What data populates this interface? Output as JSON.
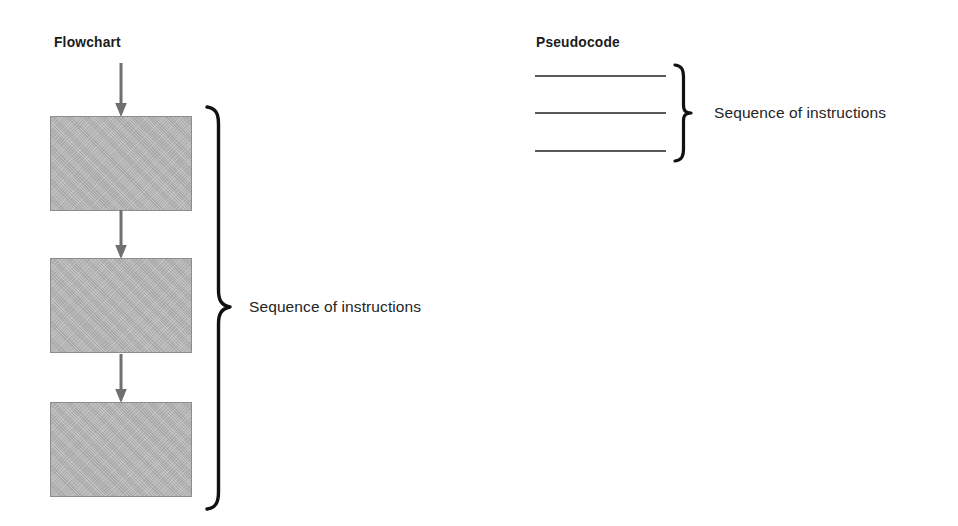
{
  "diagram": {
    "title_flowchart": "Flowchart",
    "title_pseudocode": "Pseudocode",
    "caption_flowchart": "Sequence of instructions",
    "caption_pseudocode": "Sequence of instructions",
    "colors": {
      "box_fill": "#b5b5b5",
      "box_border": "#8d8d8d",
      "arrow": "#6f6f6f",
      "brace": "#111111",
      "code_rule": "#5a5a5a",
      "text": "#1c1c1c",
      "background": "#ffffff"
    },
    "flowchart": {
      "heading": "Flowchart",
      "entry_arrow": "down-arrow",
      "boxes": [
        {
          "name": "process-box-1",
          "label": ""
        },
        {
          "name": "process-box-2",
          "label": ""
        },
        {
          "name": "process-box-3",
          "label": ""
        }
      ],
      "connectors": [
        {
          "name": "connector-arrow-1",
          "icon": "down-arrow"
        },
        {
          "name": "connector-arrow-2",
          "icon": "down-arrow"
        }
      ],
      "brace": "right-curly-brace",
      "caption": "Sequence of instructions"
    },
    "pseudocode": {
      "heading": "Pseudocode",
      "lines": [
        {
          "name": "code-line-1",
          "text": ""
        },
        {
          "name": "code-line-2",
          "text": ""
        },
        {
          "name": "code-line-3",
          "text": ""
        }
      ],
      "brace": "right-curly-brace",
      "caption": "Sequence of instructions"
    }
  }
}
